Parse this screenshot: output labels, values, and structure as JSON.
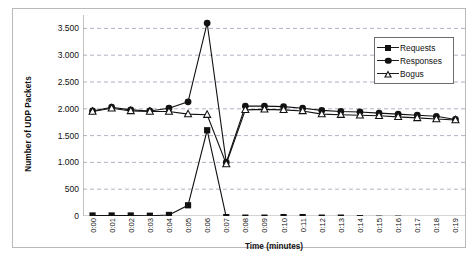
{
  "chart_data": {
    "type": "line",
    "title": "",
    "xlabel": "Time (minutes)",
    "ylabel": "Number of UDP Packets",
    "grid": true,
    "legend_position": "top-right",
    "ylim": [
      0,
      3750
    ],
    "yticks": [
      0,
      500,
      1000,
      1500,
      2000,
      2500,
      3000,
      3500
    ],
    "ytick_labels": [
      "0",
      "500",
      "1.000",
      "1.500",
      "2.000",
      "2.500",
      "3.000",
      "3.500"
    ],
    "categories": [
      "0:00",
      "0:01",
      "0:02",
      "0:03",
      "0:04",
      "0:05",
      "0:06",
      "0:07",
      "0:08",
      "0:09",
      "0:10",
      "0:11",
      "0:12",
      "0:13",
      "0:14",
      "0:15",
      "0:16",
      "0:17",
      "0:18",
      "0:19"
    ],
    "series": [
      {
        "name": "Requests",
        "marker": "filled-square",
        "color": "#111111",
        "values": [
          10,
          10,
          10,
          5,
          20,
          200,
          1600,
          -20,
          -30,
          -30,
          -20,
          -20,
          -30,
          -30,
          -40,
          -50,
          -50,
          -70,
          -80,
          -90
        ]
      },
      {
        "name": "Responses",
        "marker": "filled-circle",
        "color": "#111111",
        "values": [
          1960,
          2030,
          1980,
          1960,
          2010,
          2130,
          3600,
          1000,
          2050,
          2050,
          2040,
          2010,
          1970,
          1950,
          1940,
          1920,
          1900,
          1880,
          1860,
          1800
        ]
      },
      {
        "name": "Bogus",
        "marker": "open-triangle",
        "color": "#111111",
        "values": [
          1950,
          2010,
          1960,
          1950,
          1950,
          1900,
          1890,
          970,
          1980,
          1990,
          1980,
          1960,
          1900,
          1890,
          1880,
          1870,
          1850,
          1830,
          1810,
          1790
        ]
      }
    ]
  },
  "legend": {
    "items": [
      {
        "label": "Requests",
        "marker": "filled-square"
      },
      {
        "label": "Responses",
        "marker": "filled-circle"
      },
      {
        "label": "Bogus",
        "marker": "open-triangle"
      }
    ]
  }
}
